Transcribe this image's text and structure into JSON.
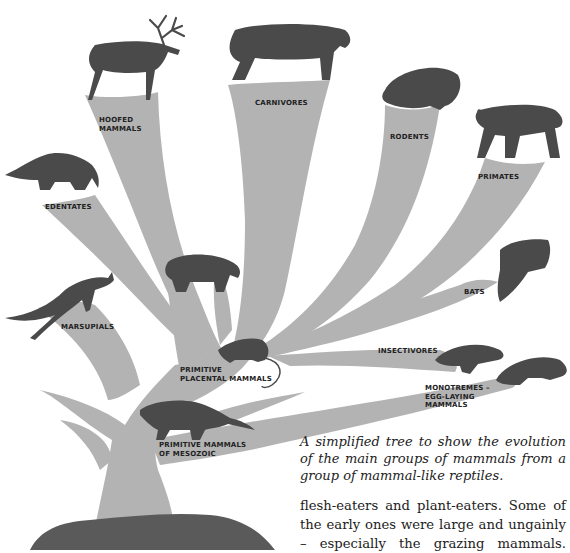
{
  "figure": {
    "colors": {
      "branch": "#b3b3b3",
      "silhouette": "#4a4a4a",
      "label": "#222222",
      "background": "#ffffff"
    },
    "labels": {
      "hoofed": [
        "HOOFED",
        "MAMMALS"
      ],
      "carnivores": "CARNIVORES",
      "rodents": "RODENTS",
      "primates": "PRIMATES",
      "edentates": "EDENTATES",
      "bats": "BATS",
      "marsupials": "MARSUPIALS",
      "insectivores": "INSECTIVORES",
      "primitive_placental": [
        "PRIMITIVE",
        "PLACENTAL MAMMALS"
      ],
      "monotremes": [
        "MONOTREMES –",
        "EGG-LAYING",
        "MAMMALS"
      ],
      "primitive_mesozoic": [
        "PRIMITIVE MAMMALS",
        "OF MESOZOIC"
      ]
    },
    "animals": [
      "deer",
      "sabre-tooth-cat",
      "guinea-pig",
      "monkey",
      "anteater",
      "rhinoceros",
      "kangaroo",
      "bat",
      "shrew",
      "mole",
      "platypus",
      "mesozoic-mammal",
      "mammal-like-reptile"
    ]
  },
  "caption": {
    "text": "A simplified tree to show the evolution of the main groups of mammals from a group of mammal-like reptiles."
  },
  "body": {
    "lines": [
      "flesh-eaters and plant-eaters. Some of",
      "the early ones were large and ungainly",
      "– especially the grazing mammals."
    ]
  }
}
